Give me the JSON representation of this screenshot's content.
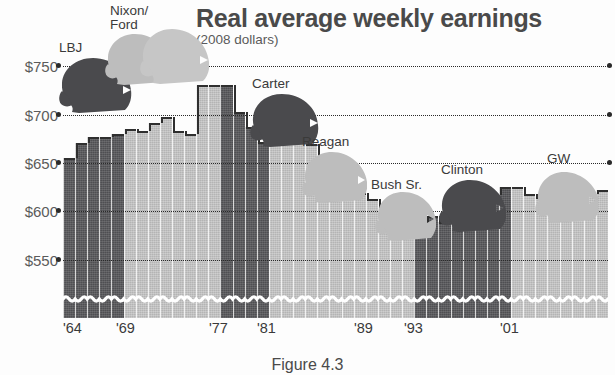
{
  "chart_data": {
    "type": "bar",
    "title": "Real average weekly earnings",
    "subtitle": "(2008 dollars)",
    "xlabel": "",
    "ylabel": "",
    "ylim": [
      520,
      772
    ],
    "grid": true,
    "legend_position": "none",
    "ytick_labels": [
      "$750",
      "$700",
      "$650",
      "$600",
      "$550"
    ],
    "ytick_values": [
      750,
      700,
      650,
      600,
      550
    ],
    "xtick_labels": [
      "'64",
      "'69",
      "'77",
      "'81",
      "'89",
      "'93",
      "'01"
    ],
    "xtick_years": [
      1964,
      1969,
      1977,
      1981,
      1989,
      1993,
      2001
    ],
    "series_colors": {
      "democrat": "#4f4f52",
      "republican": "#b4b4b4"
    },
    "categories": [
      "1964",
      "1965",
      "1966",
      "1967",
      "1968",
      "1969",
      "1970",
      "1971",
      "1972",
      "1973",
      "1974",
      "1975",
      "1976",
      "1977",
      "1978",
      "1979",
      "1980",
      "1981",
      "1982",
      "1983",
      "1984",
      "1985",
      "1986",
      "1987",
      "1988",
      "1989",
      "1990",
      "1991",
      "1992",
      "1993",
      "1994",
      "1995",
      "1996",
      "1997",
      "1998",
      "1999",
      "2000",
      "2001",
      "2002",
      "2003",
      "2004",
      "2005",
      "2006",
      "2007",
      "2008"
    ],
    "values": [
      676,
      691,
      697,
      697,
      700,
      705,
      703,
      710,
      716,
      703,
      700,
      748,
      748,
      748,
      721,
      707,
      692,
      692,
      703,
      703,
      690,
      673,
      662,
      650,
      642,
      636,
      628,
      620,
      614,
      612,
      620,
      614,
      614,
      624,
      635,
      640,
      648,
      648,
      641,
      638,
      636,
      633,
      638,
      641,
      645
    ],
    "party_by_year": [
      "democrat",
      "democrat",
      "democrat",
      "democrat",
      "democrat",
      "republican",
      "republican",
      "republican",
      "republican",
      "republican",
      "republican",
      "republican",
      "republican",
      "democrat",
      "democrat",
      "democrat",
      "democrat",
      "republican",
      "republican",
      "republican",
      "republican",
      "republican",
      "republican",
      "republican",
      "republican",
      "republican",
      "republican",
      "republican",
      "republican",
      "democrat",
      "democrat",
      "democrat",
      "democrat",
      "democrat",
      "democrat",
      "democrat",
      "democrat",
      "republican",
      "republican",
      "republican",
      "republican",
      "republican",
      "republican",
      "republican",
      "republican"
    ],
    "annotations": [
      {
        "name": "LBJ",
        "party": "democrat"
      },
      {
        "name": "Nixon/\nFord",
        "party": "republican"
      },
      {
        "name": "Carter",
        "party": "democrat"
      },
      {
        "name": "Reagan",
        "party": "republican"
      },
      {
        "name": "Bush Sr.",
        "party": "republican"
      },
      {
        "name": "Clinton",
        "party": "democrat"
      },
      {
        "name": "GW",
        "party": "republican"
      }
    ]
  },
  "labels": {
    "lbj": "LBJ",
    "nixon_ford": "Nixon/\nFord",
    "carter": "Carter",
    "reagan": "Reagan",
    "bush_sr": "Bush Sr.",
    "clinton": "Clinton",
    "gw": "GW"
  },
  "yticks": {
    "t750": "$750",
    "t700": "$700",
    "t650": "$650",
    "t600": "$600",
    "t550": "$550"
  },
  "xticks": {
    "x64": "'64",
    "x69": "'69",
    "x77": "'77",
    "x81": "'81",
    "x89": "'89",
    "x93": "'93",
    "x01": "'01"
  },
  "caption": "Figure 4.3"
}
